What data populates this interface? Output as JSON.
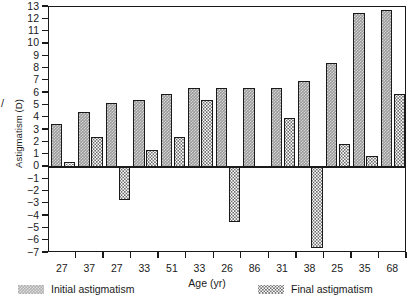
{
  "chart_data": {
    "type": "bar",
    "title": "",
    "xlabel": "Age (yr)",
    "ylabel": "Astigmatism (D)",
    "categories": [
      "27",
      "37",
      "27",
      "33",
      "51",
      "33",
      "26",
      "86",
      "31",
      "38",
      "25",
      "35",
      "68"
    ],
    "ylim": [
      -7,
      13
    ],
    "yticks": [
      13,
      12,
      11,
      10,
      9,
      8,
      7,
      6,
      5,
      4,
      3,
      2,
      1,
      0,
      -1,
      -2,
      -3,
      -4,
      -5,
      -6,
      -7
    ],
    "ytick_labels": [
      "13",
      "12",
      "11",
      "10",
      "9",
      "8",
      "7",
      "6",
      "5",
      "4",
      "3",
      "2",
      "1",
      "0",
      "−1",
      "−2",
      "−3",
      "−4",
      "−5",
      "−6",
      "−7"
    ],
    "grid": false,
    "legend_position": "bottom",
    "series": [
      {
        "name": "Initial astigmatism",
        "pattern": "dark-checker",
        "values": [
          3.45,
          4.45,
          5.2,
          5.45,
          5.95,
          6.4,
          6.4,
          6.45,
          6.45,
          6.95,
          8.45,
          12.55,
          12.75
        ]
      },
      {
        "name": "Final astigmatism",
        "pattern": "light-dotted",
        "values": [
          0.4,
          2.4,
          -2.7,
          1.35,
          2.4,
          5.4,
          -4.5,
          null,
          3.95,
          -6.6,
          1.9,
          0.85,
          5.95
        ]
      }
    ]
  },
  "axis_stub": "/",
  "legend": {
    "initial_label": "Initial astigmatism",
    "final_label": "Final astigmatism",
    "initial_swatch": "dark-checker-swatch",
    "final_swatch": "light-dotted-swatch"
  },
  "colors": {
    "axis": "#1a1a1a",
    "initial_fill": "#9a9a9a",
    "final_fill": "#ffffff",
    "final_dots": "#6d6d6d",
    "background": "#ffffff"
  }
}
